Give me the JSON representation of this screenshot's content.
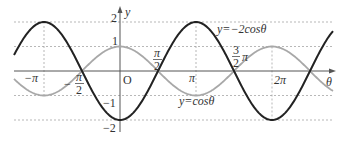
{
  "chart_data": {
    "type": "line",
    "title": "",
    "xlabel": "θ",
    "ylabel": "y",
    "xlim": [
      -4.37,
      8.8
    ],
    "ylim": [
      -2,
      2
    ],
    "grid": "dashed guides at y=±1, ±2 and x=-π, π, 2π",
    "series": [
      {
        "name": "y=-2cosθ",
        "function": "-2*cos(theta)",
        "color": "#222222",
        "amplitude": 2
      },
      {
        "name": "y=cosθ",
        "function": "cos(theta)",
        "color": "#a8a8a8",
        "amplitude": 1
      }
    ],
    "x_tick_labels": [
      "-π",
      "-π/2",
      "O",
      "π/2",
      "π",
      "3/2π",
      "2π"
    ],
    "y_tick_labels": [
      "2",
      "1",
      "-1",
      "-2"
    ],
    "annotations": [
      "y=-2cosθ",
      "y=cosθ"
    ]
  },
  "labels": {
    "y_axis": "y",
    "x_axis": "θ",
    "origin": "O",
    "y2": "2",
    "y1": "1",
    "ym1": "−1",
    "ym2": "−2",
    "neg_pi": "−π",
    "neg_half_num": "π",
    "neg_half_den": "2",
    "neg_sign": "−",
    "half_num": "π",
    "half_den": "2",
    "pi": "π",
    "three_num": "3",
    "three_den": "2",
    "three_pi": "π",
    "two_pi": "2π",
    "curve_neg2cos": "y=−2cosθ",
    "curve_cos": "y=cosθ"
  }
}
